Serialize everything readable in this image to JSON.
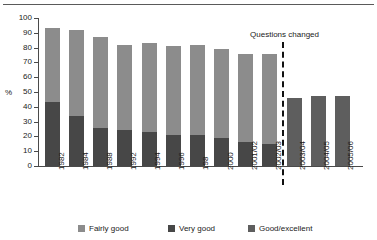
{
  "chart_data": {
    "type": "bar",
    "stacked": true,
    "title": "",
    "xlabel": "",
    "ylabel": "%",
    "ylim": [
      0,
      100
    ],
    "yticks": [
      0,
      10,
      20,
      30,
      40,
      50,
      60,
      70,
      80,
      90,
      100
    ],
    "grid": false,
    "legend_position": "bottom",
    "categories": [
      "1982",
      "1984",
      "1988",
      "1992",
      "1994",
      "1996",
      "198",
      "2000",
      "2001/02",
      "2002/03",
      "2003/04",
      "2004/05",
      "2005/06"
    ],
    "series": [
      {
        "name": "Very good",
        "color": "#474747",
        "values": [
          43,
          34,
          26,
          24,
          23,
          21,
          21,
          19,
          16,
          15,
          null,
          null,
          null
        ]
      },
      {
        "name": "Fairly good",
        "color": "#8c8c8c",
        "values": [
          50,
          58,
          61,
          58,
          60,
          60,
          61,
          60,
          60,
          61,
          null,
          null,
          null
        ]
      },
      {
        "name": "Good/excellent",
        "color": "#5e5e5e",
        "values": [
          null,
          null,
          null,
          null,
          null,
          null,
          null,
          null,
          null,
          null,
          46,
          47,
          47
        ]
      }
    ],
    "totals": [
      93,
      92,
      87,
      82,
      83,
      81,
      82,
      79,
      76,
      76,
      46,
      47,
      47
    ],
    "annotations": [
      {
        "text": "Questions changed",
        "type": "vertical-dashed-line",
        "after_category": "2002/03"
      }
    ]
  },
  "legend": {
    "items": [
      {
        "label": "Fairly good",
        "color": "#8c8c8c"
      },
      {
        "label": "Very good",
        "color": "#474747"
      },
      {
        "label": "Good/excellent",
        "color": "#5e5e5e"
      }
    ]
  },
  "axis": {
    "y_title": "%"
  }
}
